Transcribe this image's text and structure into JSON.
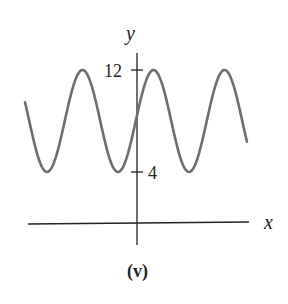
{
  "figure": {
    "caption": "(v)",
    "axis_x_label": "x",
    "axis_y_label": "y",
    "tick_12": "12",
    "tick_4": "4"
  },
  "colors": {
    "curve": "#6e6e6e",
    "axes": "#222222"
  },
  "chart_data": {
    "type": "line",
    "title": "",
    "caption": "(v)",
    "xlabel": "x",
    "ylabel": "y",
    "yticks": [
      4,
      12
    ],
    "xticks": [],
    "grid": false,
    "legend": null,
    "series": [
      {
        "name": "curve",
        "function": "y = 8 + 4*sin(k*x + phase)",
        "min": 4,
        "max": 12,
        "midline": 8,
        "amplitude": 4,
        "points_px_note": "peaks at pixel x≈82,154,224; troughs at ≈48,118,189; y-axis at pixel x≈137",
        "x": [
          -2.5,
          -1.55,
          -1.0,
          -0.5,
          0.0,
          0.45,
          0.95,
          1.45,
          1.95,
          2.5
        ],
        "y": [
          10.2,
          4,
          12,
          4,
          8.5,
          12,
          4,
          12,
          4,
          6.5
        ]
      }
    ],
    "ylim": [
      0,
      13
    ]
  }
}
